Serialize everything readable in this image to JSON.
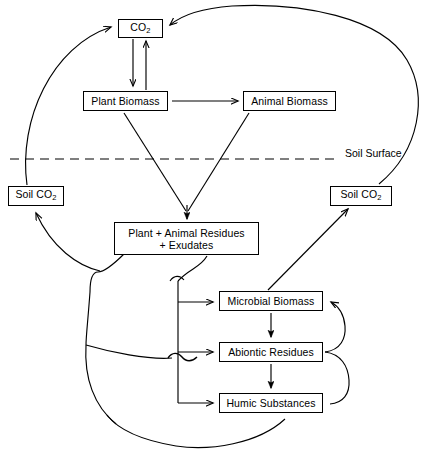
{
  "diagram": {
    "stroke_color": "#000000",
    "background_color": "#ffffff",
    "nodes": [
      {
        "id": "co2",
        "label": "CO",
        "sub": "2",
        "x": 118,
        "y": 19,
        "w": 45,
        "h": 19
      },
      {
        "id": "plant_biomass",
        "label": "Plant Biomass",
        "sub": "",
        "x": 83,
        "y": 91,
        "w": 85,
        "h": 20
      },
      {
        "id": "animal_biomass",
        "label": "Animal Biomass",
        "sub": "",
        "x": 243,
        "y": 91,
        "w": 93,
        "h": 20
      },
      {
        "id": "soil_co2_left",
        "label": "Soil CO",
        "sub": "2",
        "x": 8,
        "y": 186,
        "w": 56,
        "h": 20
      },
      {
        "id": "soil_co2_right",
        "label": "Soil CO",
        "sub": "2",
        "x": 330,
        "y": 186,
        "w": 62,
        "h": 20
      },
      {
        "id": "residues_exudates",
        "label": "Plant + Animal Residues\n+ Exudates",
        "sub": "",
        "x": 114,
        "y": 222,
        "w": 145,
        "h": 33
      },
      {
        "id": "microbial_biomass",
        "label": "Microbial Biomass",
        "sub": "",
        "x": 219,
        "y": 291,
        "w": 104,
        "h": 20
      },
      {
        "id": "abiontic_residues",
        "label": "Abiontic Residues",
        "sub": "",
        "x": 219,
        "y": 342,
        "w": 104,
        "h": 20
      },
      {
        "id": "humic_substances",
        "label": "Humic Substances",
        "sub": "",
        "x": 219,
        "y": 393,
        "w": 104,
        "h": 20
      }
    ],
    "labels": [
      {
        "id": "soil_surface",
        "text": "Soil Surface",
        "x": 345,
        "y": 147
      }
    ]
  }
}
